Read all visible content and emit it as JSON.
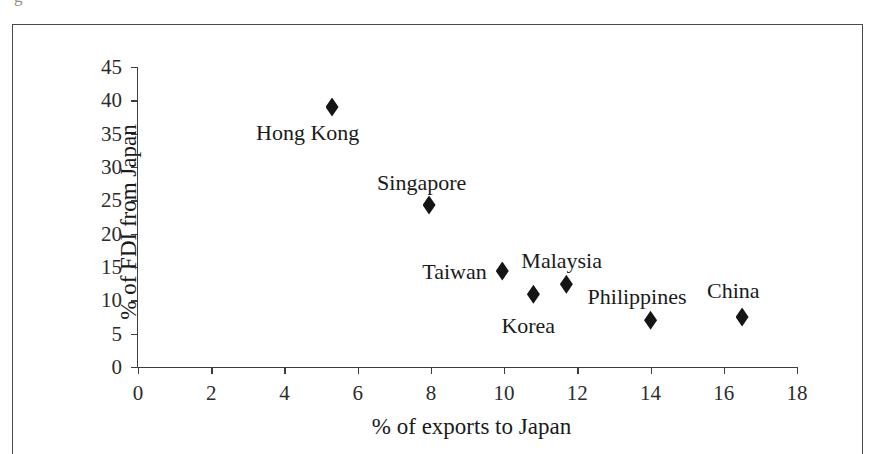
{
  "figure": {
    "clipped_text_above": "g",
    "frame_color": "#4a4a4a",
    "background": "#ffffff"
  },
  "chart_data": {
    "type": "scatter",
    "title": "",
    "xlabel": "% of exports to Japan",
    "ylabel": "% of FDI from Japan",
    "xlim": [
      0,
      18
    ],
    "ylim": [
      0,
      45
    ],
    "xticks": [
      0,
      2,
      4,
      6,
      8,
      10,
      12,
      14,
      16,
      18
    ],
    "yticks": [
      0,
      5,
      10,
      15,
      20,
      25,
      30,
      35,
      40,
      45
    ],
    "xtick_labels": [
      "0",
      "2",
      "4",
      "6",
      "8",
      "10",
      "12",
      "14",
      "16",
      "18"
    ],
    "ytick_labels": [
      "0",
      "5",
      "10",
      "15",
      "20",
      "25",
      "30",
      "35",
      "40",
      "45"
    ],
    "grid": false,
    "legend": false,
    "marker": "diamond",
    "marker_color": "#151515",
    "points": [
      {
        "label": "Hong Kong",
        "x": 5.3,
        "y": 39.0,
        "label_dx": -76,
        "label_dy": 26
      },
      {
        "label": "Singapore",
        "x": 7.95,
        "y": 24.3,
        "label_dx": -52,
        "label_dy": -22
      },
      {
        "label": "Taiwan",
        "x": 9.95,
        "y": 14.4,
        "label_dx": -80,
        "label_dy": 1
      },
      {
        "label": "Korea",
        "x": 10.8,
        "y": 10.9,
        "label_dx": -32,
        "label_dy": 32
      },
      {
        "label": "Malaysia",
        "x": 11.7,
        "y": 12.4,
        "label_dx": -45,
        "label_dy": -23
      },
      {
        "label": "Philippines",
        "x": 14.0,
        "y": 7.0,
        "label_dx": -63,
        "label_dy": -23
      },
      {
        "label": "China",
        "x": 16.5,
        "y": 7.5,
        "label_dx": -35,
        "label_dy": -26
      }
    ]
  }
}
